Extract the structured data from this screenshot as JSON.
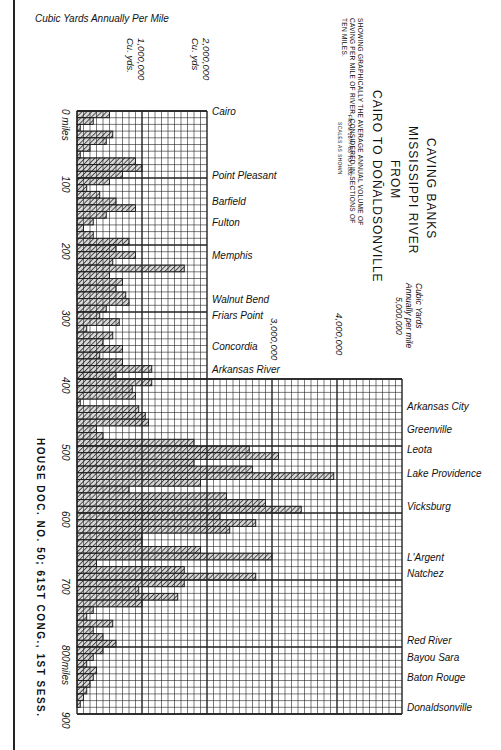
{
  "header": {
    "axis_caption": "Cubic Yards Annually Per Mile",
    "tick_1m": "1,000,000",
    "tick_1m_unit": "Cu. yds.",
    "tick_2m": "2,000,000",
    "tick_2m_unit": "Cu. yds",
    "tick_3m": "3,000,000",
    "tick_4m": "4,000,000",
    "tick_5m_caption_1": "Cubic Yards",
    "tick_5m_caption_2": "Annually per mile",
    "tick_5m": "5,000,000"
  },
  "title": {
    "line1": "CAVING BANKS",
    "line2": "MISSISSIPPI RIVER",
    "line3": "FROM",
    "line4": "CAIRO TO DOÑALDSONVILLE",
    "desc1": "SHOWING GRAPHICALLY THE AVERAGE ANNUAL VOLUME OF",
    "desc2": "CAVING PER MILE OF RIVER, CONSIDERED IN SECTIONS OF",
    "desc3": "TEN MILES.",
    "period": "FROM 1877-83 TO 1882",
    "scales": "SCALES AS SHOWN"
  },
  "footer": {
    "house_doc": "HOUSE DOC. NO. 50; 61ST CONG., 1ST SESS."
  },
  "mile_labels": [
    {
      "label": "0 miles",
      "mile": 0
    },
    {
      "label": "100",
      "mile": 100
    },
    {
      "label": "200",
      "mile": 200
    },
    {
      "label": "300",
      "mile": 300
    },
    {
      "label": "400",
      "mile": 400
    },
    {
      "label": "500",
      "mile": 500
    },
    {
      "label": "600",
      "mile": 600
    },
    {
      "label": "700",
      "mile": 700
    },
    {
      "label": "800miles",
      "mile": 800
    },
    {
      "label": "900",
      "mile": 900
    }
  ],
  "places": [
    {
      "name": "Cairo",
      "mile": 0
    },
    {
      "name": "Point Pleasant",
      "mile": 95
    },
    {
      "name": "Barfield",
      "mile": 135
    },
    {
      "name": "Fulton",
      "mile": 165
    },
    {
      "name": "Memphis",
      "mile": 215
    },
    {
      "name": "Walnut Bend",
      "mile": 280
    },
    {
      "name": "Friars Point",
      "mile": 305
    },
    {
      "name": "Concordia",
      "mile": 350
    },
    {
      "name": "Arkansas River",
      "mile": 385
    },
    {
      "name": "Arkansas City",
      "mile": 440
    },
    {
      "name": "Greenville",
      "mile": 475
    },
    {
      "name": "Leota",
      "mile": 505
    },
    {
      "name": "Lake Providence",
      "mile": 540
    },
    {
      "name": "Vicksburg",
      "mile": 590
    },
    {
      "name": "L'Argent",
      "mile": 665
    },
    {
      "name": "Natchez",
      "mile": 690
    },
    {
      "name": "Red River",
      "mile": 790
    },
    {
      "name": "Bayou Sara",
      "mile": 815
    },
    {
      "name": "Baton Rouge",
      "mile": 845
    },
    {
      "name": "Donaldsonville",
      "mile": 890
    }
  ],
  "colors": {
    "ink": "#1a1a1a",
    "grid": "#222222",
    "paper": "#ffffff",
    "hatch": "#555555"
  },
  "chart_data": {
    "type": "bar",
    "orientation": "horizontal",
    "subtitle": "Average annual volume of caving per mile of river, in sections of ten miles (1877-83 to 1882)",
    "xlabel": "Cubic Yards Annually Per Mile",
    "ylabel": "Miles below Cairo",
    "xlim": [
      0,
      5000000
    ],
    "ylim": [
      0,
      900
    ],
    "grid": true,
    "x_tick_labels": [
      "1,000,000",
      "2,000,000",
      "3,000,000",
      "4,000,000",
      "5,000,000"
    ],
    "y_tick_labels": [
      "0",
      "100",
      "200",
      "300",
      "400",
      "500",
      "600",
      "700",
      "800",
      "900"
    ],
    "section_miles": 10,
    "categories": [
      "0-10",
      "10-20",
      "20-30",
      "30-40",
      "40-50",
      "50-60",
      "60-70",
      "70-80",
      "80-90",
      "90-100",
      "100-110",
      "110-120",
      "120-130",
      "130-140",
      "140-150",
      "150-160",
      "160-170",
      "170-180",
      "180-190",
      "190-200",
      "200-210",
      "210-220",
      "220-230",
      "230-240",
      "240-250",
      "250-260",
      "260-270",
      "270-280",
      "280-290",
      "290-300",
      "300-310",
      "310-320",
      "320-330",
      "330-340",
      "340-350",
      "350-360",
      "360-370",
      "370-380",
      "380-390",
      "390-400",
      "400-410",
      "410-420",
      "420-430",
      "430-440",
      "440-450",
      "450-460",
      "460-470",
      "470-480",
      "480-490",
      "490-500",
      "500-510",
      "510-520",
      "520-530",
      "530-540",
      "540-550",
      "550-560",
      "560-570",
      "570-580",
      "580-590",
      "590-600",
      "600-610",
      "610-620",
      "620-630",
      "630-640",
      "640-650",
      "650-660",
      "660-670",
      "670-680",
      "680-690",
      "690-700",
      "700-710",
      "710-720",
      "720-730",
      "730-740",
      "740-750",
      "750-760",
      "760-770",
      "770-780",
      "780-790",
      "790-800",
      "800-810",
      "810-820",
      "820-830",
      "830-840",
      "840-850",
      "850-860",
      "860-870",
      "870-880",
      "880-890",
      "890-900"
    ],
    "values": [
      500000,
      250000,
      50000,
      550000,
      450000,
      200000,
      50000,
      900000,
      1000000,
      700000,
      500000,
      150000,
      350000,
      600000,
      900000,
      450000,
      250000,
      100000,
      250000,
      800000,
      600000,
      900000,
      550000,
      1650000,
      500000,
      700000,
      600000,
      750000,
      800000,
      450000,
      350000,
      650000,
      150000,
      550000,
      400000,
      700000,
      350000,
      700000,
      1150000,
      600000,
      1150000,
      850000,
      900000,
      50000,
      950000,
      1050000,
      1100000,
      300000,
      400000,
      1800000,
      2650000,
      3100000,
      1800000,
      2700000,
      3950000,
      1900000,
      800000,
      2300000,
      2900000,
      3450000,
      2200000,
      2750000,
      2350000,
      1000000,
      1000000,
      1900000,
      3000000,
      300000,
      1650000,
      2750000,
      1650000,
      950000,
      1550000,
      1000000,
      250000,
      150000,
      550000,
      250000,
      400000,
      600000,
      400000,
      250000,
      150000,
      300000,
      250000,
      200000,
      150000,
      100000,
      50000,
      0
    ]
  }
}
